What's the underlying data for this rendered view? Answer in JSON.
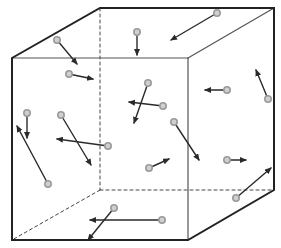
{
  "diagram": {
    "colors": {
      "edge": "#222222",
      "hidden_edge": "#444444",
      "inner_edge": "#555555",
      "arrow": "#2a2a2a",
      "particle_fill": "#cfcfcf",
      "particle_stroke": "#9a9a9a"
    },
    "cube": {
      "vertices": {
        "front_top_left": [
          12,
          58
        ],
        "front_top_right": [
          188,
          58
        ],
        "front_bottom_left": [
          12,
          240
        ],
        "front_bottom_right": [
          188,
          240
        ],
        "back_top_left": [
          100,
          8
        ],
        "back_top_right": [
          274,
          8
        ],
        "back_bottom_right": [
          274,
          190
        ],
        "back_bottom_left": [
          100,
          190
        ]
      }
    },
    "particles": [
      {
        "id": "p1",
        "x": 57,
        "y": 40,
        "dx": 77,
        "dy": 64
      },
      {
        "id": "p2",
        "x": 69,
        "y": 74,
        "dx": 93,
        "dy": 79
      },
      {
        "id": "p3",
        "x": 137,
        "y": 32,
        "dx": 137,
        "dy": 55
      },
      {
        "id": "p4",
        "x": 217,
        "y": 13,
        "dx": 171,
        "dy": 40
      },
      {
        "id": "p5",
        "x": 148,
        "y": 83,
        "dx": 134,
        "dy": 123
      },
      {
        "id": "p6",
        "x": 163,
        "y": 106,
        "dx": 129,
        "dy": 102
      },
      {
        "id": "p7",
        "x": 227,
        "y": 90,
        "dx": 205,
        "dy": 90
      },
      {
        "id": "p8",
        "x": 268,
        "y": 99,
        "dx": 256,
        "dy": 70
      },
      {
        "id": "p9",
        "x": 27,
        "y": 113,
        "dx": 27,
        "dy": 138
      },
      {
        "id": "p10",
        "x": 61,
        "y": 115,
        "dx": 91,
        "dy": 165
      },
      {
        "id": "p11",
        "x": 108,
        "y": 146,
        "dx": 57,
        "dy": 139
      },
      {
        "id": "p12",
        "x": 174,
        "y": 122,
        "dx": 199,
        "dy": 160
      },
      {
        "id": "p13",
        "x": 48,
        "y": 184,
        "dx": 17,
        "dy": 126
      },
      {
        "id": "p14",
        "x": 149,
        "y": 168,
        "dx": 169,
        "dy": 159
      },
      {
        "id": "p15",
        "x": 227,
        "y": 160,
        "dx": 246,
        "dy": 160
      },
      {
        "id": "p16",
        "x": 236,
        "y": 198,
        "dx": 271,
        "dy": 168
      },
      {
        "id": "p17",
        "x": 114,
        "y": 208,
        "dx": 88,
        "dy": 240
      },
      {
        "id": "p18",
        "x": 162,
        "y": 220,
        "dx": 90,
        "dy": 220
      }
    ]
  }
}
